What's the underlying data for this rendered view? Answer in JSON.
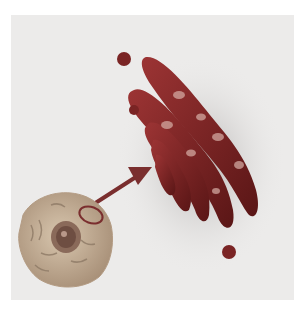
{
  "image": {
    "subject": "Golgi apparatus illustration with animal cell and arrow",
    "colors": {
      "border": "#ffffff",
      "background": "#ecebea",
      "cisternae": "#8a2a2a",
      "cisternae_dark": "#5e1818",
      "vesicle": "#7a2424",
      "cell": "#c9b39a",
      "cell_detail": "#8e7a66",
      "nucleus": "#6e4e42",
      "arrow": "#7a2e2e"
    }
  }
}
